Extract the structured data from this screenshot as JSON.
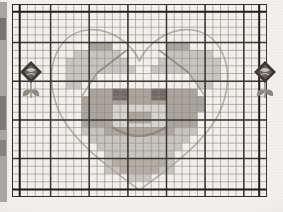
{
  "document": {
    "kind": "cross-stitch-pattern-chart",
    "title": "Teddy Bear in Heart Cross Stitch Chart",
    "media": "scanned printed pattern page",
    "background_color": "#f4f2ee"
  },
  "canvas": {
    "width": 283,
    "height": 212
  },
  "page_margin": {
    "binding_strip": {
      "description": "dark scanned page binding strip at far left edge",
      "x": 0,
      "y": 2,
      "width": 7,
      "height": 200,
      "color": "#6f6a64"
    }
  },
  "grid": {
    "origin_x": 12.0,
    "origin_y": 4.0,
    "cell_size": 7.72,
    "cols": 33,
    "rows": 25,
    "minor_line_color": "#8d8881",
    "minor_line_width": 0.7,
    "major_line_color": "#3a3733",
    "major_line_width": 1.5,
    "major_every": 5,
    "border_color": "#2e2b28",
    "border_width": 1.8,
    "section_divider_color": "#241f1c",
    "section_dividers": [
      {
        "orientation": "vertical",
        "cell": 32,
        "label": "right-section-divider"
      },
      {
        "orientation": "vertical",
        "cell": 1,
        "label": "left-section-divider"
      },
      {
        "orientation": "horizontal",
        "cell": 1,
        "label": "top-section-divider"
      },
      {
        "orientation": "horizontal",
        "cell": 24,
        "label": "bottom-section-divider"
      }
    ]
  },
  "palette": {
    "heart_outline": "#b9b2a8",
    "bear_light": "#c8c4bd",
    "bear_mid": "#a7a29a",
    "bear_dark": "#8a857d",
    "bear_darkest": "#6c6760",
    "muzzle_light": "#d9d5cf",
    "eye": "#5a5550",
    "flower_dark": "#3c3833",
    "flower_mid": "#6b665f",
    "stem": "#9b958d"
  },
  "motifs": {
    "heart": {
      "name": "heart-outline",
      "stroke": "#b9b2a8",
      "stroke_width": 1.6,
      "description": "large single-line heart outline spanning the chart, apex dip at top centre, point at bottom centre",
      "path": "M143,192 C116,172 70,140 58,106 C44,66 60,34 88,30 C112,27 134,44 143,62 C152,44 174,27 198,30 C226,34 242,66 228,106 C216,140 170,172 143,192 Z"
    },
    "bear": {
      "name": "teddy-bear-face",
      "description": "pixelated teddy bear head with two ears, two eyes, muzzle, nose and smiling mouth, rendered as filled grid cells",
      "cells_light": [
        [
          8,
          7
        ],
        [
          9,
          7
        ],
        [
          10,
          7
        ],
        [
          11,
          7
        ],
        [
          12,
          7
        ],
        [
          20,
          7
        ],
        [
          21,
          7
        ],
        [
          22,
          7
        ],
        [
          23,
          7
        ],
        [
          24,
          7
        ],
        [
          7,
          8
        ],
        [
          8,
          8
        ],
        [
          9,
          8
        ],
        [
          10,
          8
        ],
        [
          11,
          8
        ],
        [
          12,
          8
        ],
        [
          13,
          8
        ],
        [
          19,
          8
        ],
        [
          20,
          8
        ],
        [
          21,
          8
        ],
        [
          22,
          8
        ],
        [
          23,
          8
        ],
        [
          24,
          8
        ],
        [
          25,
          8
        ],
        [
          7,
          9
        ],
        [
          8,
          9
        ],
        [
          9,
          9
        ],
        [
          10,
          9
        ],
        [
          11,
          9
        ],
        [
          12,
          9
        ],
        [
          13,
          9
        ],
        [
          14,
          9
        ],
        [
          18,
          9
        ],
        [
          19,
          9
        ],
        [
          20,
          9
        ],
        [
          21,
          9
        ],
        [
          22,
          9
        ],
        [
          23,
          9
        ],
        [
          24,
          9
        ],
        [
          25,
          9
        ],
        [
          7,
          10
        ],
        [
          8,
          10
        ],
        [
          9,
          10
        ],
        [
          10,
          10
        ],
        [
          23,
          10
        ],
        [
          24,
          10
        ],
        [
          25,
          10
        ],
        [
          7,
          11
        ],
        [
          8,
          11
        ],
        [
          24,
          11
        ],
        [
          25,
          11
        ],
        [
          9,
          16
        ],
        [
          10,
          16
        ],
        [
          11,
          16
        ],
        [
          12,
          16
        ],
        [
          13,
          16
        ],
        [
          14,
          16
        ],
        [
          15,
          16
        ],
        [
          16,
          16
        ],
        [
          17,
          16
        ],
        [
          18,
          16
        ],
        [
          19,
          16
        ],
        [
          20,
          16
        ],
        [
          21,
          16
        ],
        [
          22,
          16
        ],
        [
          23,
          16
        ],
        [
          10,
          17
        ],
        [
          11,
          17
        ],
        [
          12,
          17
        ],
        [
          13,
          17
        ],
        [
          14,
          17
        ],
        [
          15,
          17
        ],
        [
          16,
          17
        ],
        [
          17,
          17
        ],
        [
          18,
          17
        ],
        [
          19,
          17
        ],
        [
          20,
          17
        ],
        [
          21,
          17
        ],
        [
          22,
          17
        ],
        [
          11,
          18
        ],
        [
          12,
          18
        ],
        [
          13,
          18
        ],
        [
          14,
          18
        ],
        [
          15,
          18
        ],
        [
          16,
          18
        ],
        [
          17,
          18
        ],
        [
          18,
          18
        ],
        [
          19,
          18
        ],
        [
          20,
          18
        ],
        [
          21,
          18
        ],
        [
          12,
          19
        ],
        [
          13,
          19
        ],
        [
          14,
          19
        ],
        [
          15,
          19
        ],
        [
          16,
          19
        ],
        [
          17,
          19
        ],
        [
          18,
          19
        ],
        [
          19,
          19
        ],
        [
          20,
          19
        ],
        [
          13,
          20
        ],
        [
          14,
          20
        ],
        [
          15,
          20
        ],
        [
          16,
          20
        ],
        [
          17,
          20
        ],
        [
          18,
          20
        ],
        [
          19,
          20
        ],
        [
          14,
          21
        ],
        [
          15,
          21
        ],
        [
          16,
          21
        ],
        [
          17,
          21
        ],
        [
          18,
          21
        ],
        [
          15,
          22
        ],
        [
          16,
          22
        ],
        [
          17,
          22
        ]
      ],
      "cells_mid": [
        [
          10,
          6
        ],
        [
          11,
          6
        ],
        [
          12,
          6
        ],
        [
          20,
          6
        ],
        [
          21,
          6
        ],
        [
          22,
          6
        ],
        [
          10,
          11
        ],
        [
          11,
          11
        ],
        [
          12,
          11
        ],
        [
          13,
          11
        ],
        [
          14,
          11
        ],
        [
          15,
          11
        ],
        [
          16,
          11
        ],
        [
          17,
          11
        ],
        [
          18,
          11
        ],
        [
          19,
          11
        ],
        [
          20,
          11
        ],
        [
          21,
          11
        ],
        [
          22,
          11
        ],
        [
          23,
          11
        ],
        [
          9,
          12
        ],
        [
          10,
          12
        ],
        [
          11,
          12
        ],
        [
          12,
          12
        ],
        [
          13,
          12
        ],
        [
          14,
          12
        ],
        [
          15,
          12
        ],
        [
          16,
          12
        ],
        [
          17,
          12
        ],
        [
          18,
          12
        ],
        [
          19,
          12
        ],
        [
          20,
          12
        ],
        [
          21,
          12
        ],
        [
          22,
          12
        ],
        [
          23,
          12
        ],
        [
          24,
          12
        ],
        [
          9,
          13
        ],
        [
          10,
          13
        ],
        [
          11,
          13
        ],
        [
          12,
          13
        ],
        [
          13,
          13
        ],
        [
          14,
          13
        ],
        [
          15,
          13
        ],
        [
          16,
          13
        ],
        [
          17,
          13
        ],
        [
          18,
          13
        ],
        [
          19,
          13
        ],
        [
          20,
          13
        ],
        [
          21,
          13
        ],
        [
          22,
          13
        ],
        [
          23,
          13
        ],
        [
          24,
          13
        ],
        [
          9,
          14
        ],
        [
          10,
          14
        ],
        [
          11,
          14
        ],
        [
          12,
          14
        ],
        [
          13,
          14
        ],
        [
          14,
          14
        ],
        [
          15,
          14
        ],
        [
          16,
          14
        ],
        [
          17,
          14
        ],
        [
          18,
          14
        ],
        [
          19,
          14
        ],
        [
          20,
          14
        ],
        [
          21,
          14
        ],
        [
          22,
          14
        ],
        [
          23,
          14
        ],
        [
          9,
          15
        ],
        [
          10,
          15
        ],
        [
          11,
          15
        ],
        [
          12,
          15
        ],
        [
          13,
          15
        ],
        [
          14,
          15
        ],
        [
          15,
          15
        ],
        [
          16,
          15
        ],
        [
          17,
          15
        ],
        [
          18,
          15
        ],
        [
          19,
          15
        ],
        [
          20,
          15
        ],
        [
          21,
          15
        ],
        [
          22,
          15
        ],
        [
          23,
          15
        ]
      ],
      "cells_dark": [
        [
          13,
          12
        ],
        [
          14,
          12
        ],
        [
          18,
          12
        ],
        [
          19,
          12
        ],
        [
          13,
          13
        ],
        [
          14,
          13
        ],
        [
          18,
          13
        ],
        [
          19,
          13
        ],
        [
          12,
          18
        ],
        [
          13,
          19
        ],
        [
          14,
          20
        ],
        [
          15,
          21
        ],
        [
          16,
          21
        ],
        [
          17,
          21
        ],
        [
          18,
          20
        ],
        [
          19,
          19
        ],
        [
          20,
          18
        ]
      ],
      "muzzle": {
        "x_cell": 13,
        "y_cell": 14,
        "w_cells": 7,
        "h_cells": 4,
        "color": "#d9d5cf"
      },
      "nose": {
        "x_cell": 15,
        "y_cell": 15,
        "w_cells": 3,
        "h_cells": 2,
        "color": "#a7a29a"
      },
      "eye_left": {
        "x_cell": 13,
        "y_cell": 12,
        "w_cells": 2,
        "h_cells": 2,
        "color": "#5a5550"
      },
      "eye_right": {
        "x_cell": 18,
        "y_cell": 12,
        "w_cells": 2,
        "h_cells": 2,
        "color": "#5a5550"
      }
    },
    "flower_left": {
      "name": "rose-motif-left",
      "x": 16,
      "y": 58,
      "width": 30,
      "height": 42,
      "bloom_color": "#3c3833",
      "stem_color": "#9b958d",
      "description": "small dark rose bloom with stem and two leaves, left margin of chart"
    },
    "flower_right": {
      "name": "rose-motif-right",
      "x": 250,
      "y": 58,
      "width": 30,
      "height": 42,
      "bloom_color": "#3c3833",
      "stem_color": "#9b958d",
      "description": "small dark rose bloom with stem and two leaves, right margin of chart"
    }
  },
  "labels": {
    "none_visible": "This scanned chart fragment shows no printed text, numbers, legend or key within the cropped area."
  }
}
